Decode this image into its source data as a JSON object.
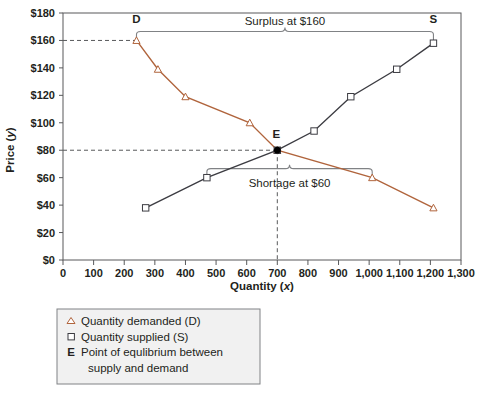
{
  "chart_data": {
    "type": "line",
    "title": "",
    "xlabel": "Quantity (x)",
    "ylabel": "Price (y)",
    "xlim": [
      0,
      1300
    ],
    "ylim": [
      0,
      180
    ],
    "xticks": [
      "0",
      "100",
      "200",
      "300",
      "400",
      "500",
      "600",
      "700",
      "800",
      "900",
      "1,000",
      "1,100",
      "1,200",
      "1,300"
    ],
    "xtick_values": [
      0,
      100,
      200,
      300,
      400,
      500,
      600,
      700,
      800,
      900,
      1000,
      1100,
      1200,
      1300
    ],
    "yticks": [
      "$0",
      "$20",
      "$40",
      "$60",
      "$80",
      "$100",
      "$120",
      "$140",
      "$160",
      "$180"
    ],
    "ytick_values": [
      0,
      20,
      40,
      60,
      80,
      100,
      120,
      140,
      160,
      180
    ],
    "grid": false,
    "legend_position": "below-plot",
    "series": [
      {
        "name": "Quantity demanded (D)",
        "marker": "triangle",
        "color": "#b0643c",
        "points": [
          {
            "x": 240,
            "y": 160
          },
          {
            "x": 310,
            "y": 139
          },
          {
            "x": 400,
            "y": 119
          },
          {
            "x": 610,
            "y": 100
          },
          {
            "x": 700,
            "y": 80
          },
          {
            "x": 1010,
            "y": 60
          },
          {
            "x": 1210,
            "y": 38
          }
        ]
      },
      {
        "name": "Quantity supplied (S)",
        "marker": "square",
        "color": "#3c3c42",
        "points": [
          {
            "x": 270,
            "y": 38
          },
          {
            "x": 470,
            "y": 60
          },
          {
            "x": 700,
            "y": 80
          },
          {
            "x": 820,
            "y": 94
          },
          {
            "x": 940,
            "y": 119
          },
          {
            "x": 1090,
            "y": 139
          },
          {
            "x": 1210,
            "y": 158
          }
        ]
      }
    ],
    "annotations": [
      {
        "name": "demand-curve-tag",
        "text": "D",
        "x": 240,
        "y": 172
      },
      {
        "name": "supply-curve-tag",
        "text": "S",
        "x": 1210,
        "y": 172
      },
      {
        "name": "equilibrium-tag",
        "text": "E",
        "x": 700,
        "y": 88
      },
      {
        "name": "surplus-bracket-label",
        "text": "Surplus at $160",
        "x_from": 240,
        "x_to": 1210,
        "y": 160
      },
      {
        "name": "shortage-bracket-label",
        "text": "Shortage at $60",
        "x_from": 470,
        "x_to": 1010,
        "y": 60
      }
    ],
    "guide_lines": [
      {
        "name": "price-160-guideline",
        "type": "horizontal",
        "value": 160,
        "style": "dashed"
      },
      {
        "name": "price-80-guideline",
        "type": "horizontal",
        "value": 80,
        "style": "dashed"
      },
      {
        "name": "quantity-700-guideline",
        "type": "vertical",
        "value": 700,
        "style": "dashed"
      }
    ],
    "equilibrium_point": {
      "x": 700,
      "y": 80,
      "label": "E"
    }
  },
  "legend": {
    "items": [
      {
        "key": "△",
        "key_type": "triangle-marker",
        "label": "Quantity demanded (D)"
      },
      {
        "key": "□",
        "key_type": "square-marker",
        "label": "Quantity supplied (S)"
      },
      {
        "key": "E",
        "key_type": "bold-letter",
        "label": "Point of equlibrium between",
        "label2": "supply and demand"
      }
    ]
  },
  "colors": {
    "demand": "#b0643c",
    "supply": "#3c3c42",
    "axis": "#58595b",
    "text": "#231f20",
    "legend_border": "#808285",
    "guideline": "#58595b",
    "bracket": "#808285"
  }
}
